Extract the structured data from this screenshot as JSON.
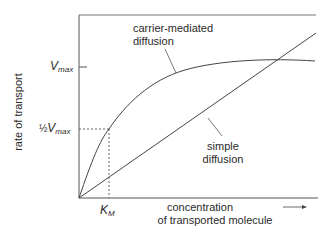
{
  "diagram": {
    "y_axis_label": "rate of transport",
    "x_axis_label_line1": "concentration",
    "x_axis_label_line2": "of transported molecule",
    "x_axis_arrow": "→",
    "vmax_label": {
      "main": "V",
      "sub": "max"
    },
    "half_vmax_label": {
      "prefix": "½",
      "main": "V",
      "sub": "max"
    },
    "km_label": {
      "main": "K",
      "sub": "M"
    },
    "curves": [
      {
        "name": "carrier-mediated diffusion",
        "label_line1": "carrier-mediated",
        "label_line2": "diffusion",
        "shape": "saturating hyperbola"
      },
      {
        "name": "simple diffusion",
        "label_line1": "simple",
        "label_line2": "diffusion",
        "shape": "linear"
      }
    ],
    "colors": {
      "line": "#444444",
      "text": "#2a2a2a",
      "background": "#ffffff"
    }
  }
}
